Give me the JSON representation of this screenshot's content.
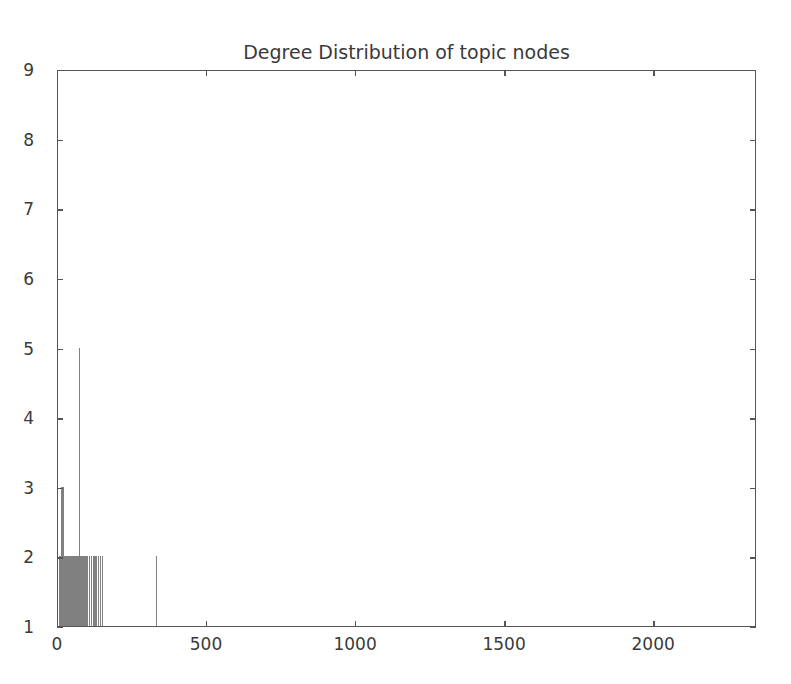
{
  "chart_data": {
    "type": "bar",
    "title": "Degree Distribution of topic nodes",
    "xlabel": "",
    "ylabel": "",
    "xlim": [
      0,
      2345
    ],
    "ylim": [
      1,
      9
    ],
    "xticks": [
      0,
      500,
      1000,
      1500,
      2000
    ],
    "yticks": [
      1,
      2,
      3,
      4,
      5,
      6,
      7,
      8,
      9
    ],
    "xtick_labels": [
      "0",
      "500",
      "1000",
      "1500",
      "2000"
    ],
    "ytick_labels": [
      "1",
      "2",
      "3",
      "4",
      "5",
      "6",
      "7",
      "8",
      "9"
    ],
    "grid": false,
    "legend": null,
    "bar_color": "#808080",
    "axes_color": "#555555",
    "background_color": "#ffffff",
    "bar_width": 3,
    "x": [
      2,
      5,
      8,
      11,
      14,
      17,
      20,
      23,
      26,
      29,
      32,
      35,
      38,
      41,
      44,
      47,
      50,
      53,
      56,
      59,
      62,
      65,
      68,
      71,
      74,
      77,
      80,
      83,
      86,
      89,
      92,
      95,
      98,
      104,
      110,
      116,
      122,
      128,
      134,
      140,
      146,
      329
    ],
    "values": [
      2,
      2,
      2,
      3,
      3,
      3,
      2,
      2,
      2,
      2,
      2,
      2,
      2,
      2,
      2,
      2,
      2,
      2,
      2,
      2,
      2,
      2,
      2,
      5,
      2,
      2,
      2,
      2,
      2,
      2,
      2,
      2,
      2,
      2,
      2,
      2,
      2,
      2,
      2,
      2,
      2,
      2
    ]
  },
  "figure": {
    "width": 791,
    "height": 684
  }
}
